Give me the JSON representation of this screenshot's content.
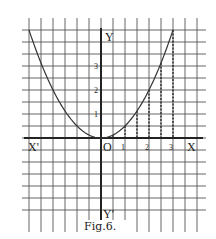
{
  "figure": {
    "caption": "Fig.6.",
    "function": "y = x^2 / 2",
    "ink_color": "#2a2a2a",
    "grid_color": "#555555",
    "background": "#ffffff"
  },
  "axes": {
    "x_label": "X",
    "x_neg_label": "X'",
    "y_label": "Y",
    "y_neg_label": "Y'",
    "origin_label": "O",
    "x_ticks": [
      "1",
      "2",
      "3"
    ],
    "y_ticks": [
      "1",
      "2",
      "3"
    ]
  },
  "chart_data": {
    "type": "line",
    "title": "Fig.6.",
    "xlabel": "X",
    "ylabel": "Y",
    "grid": true,
    "units_per_grid_square": 0.5,
    "xlim": [
      -3,
      4
    ],
    "ylim": [
      -4,
      4.5
    ],
    "x_tick_labels": [
      "1",
      "2",
      "3"
    ],
    "y_tick_labels": [
      "1",
      "2",
      "3"
    ],
    "series": [
      {
        "name": "parabola y = x^2/2",
        "x": [
          -3,
          -2.5,
          -2,
          -1.5,
          -1,
          -0.5,
          0,
          0.5,
          1,
          1.5,
          2,
          2.5,
          3
        ],
        "y": [
          4.5,
          3.125,
          2,
          1.125,
          0.5,
          0.125,
          0,
          0.125,
          0.5,
          1.125,
          2,
          3.125,
          4.5
        ]
      }
    ],
    "dashed_ordinates_at_x": [
      0.5,
      1,
      1.5,
      2,
      2.5,
      3
    ]
  }
}
